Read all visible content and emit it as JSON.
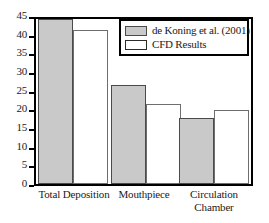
{
  "chart_data": {
    "type": "bar",
    "title": "",
    "xlabel": "",
    "ylabel": "",
    "ylim": [
      0,
      45
    ],
    "yticks": [
      0,
      5,
      10,
      15,
      20,
      25,
      30,
      35,
      40,
      45
    ],
    "grid": false,
    "legend_position": "top-right",
    "categories": [
      "Total Deposition",
      "Mouthpiece",
      "Circulation Chamber"
    ],
    "category_lines": [
      [
        "Total Deposition"
      ],
      [
        "Mouthpiece"
      ],
      [
        "Circulation",
        "Chamber"
      ]
    ],
    "series": [
      {
        "name": "de Koning et al. (2001)",
        "color": "#c9c9c9",
        "values": [
          45.0,
          27.0,
          18.0
        ]
      },
      {
        "name": "CFD Results",
        "color": "#ffffff",
        "values": [
          42.1,
          21.8,
          20.3
        ]
      }
    ]
  },
  "legend": {
    "entries": [
      {
        "label": "de Koning et al. (2001)",
        "swatch": "filled-gray-swatch"
      },
      {
        "label": "CFD Results",
        "swatch": "outline-white-swatch"
      }
    ]
  },
  "axis": {
    "y_tick_labels": [
      "45",
      "40",
      "35",
      "30",
      "25",
      "20",
      "15",
      "10",
      "5",
      "0"
    ]
  },
  "colors": {
    "series_a_fill": "#c9c9c9",
    "series_b_fill": "#ffffff",
    "frame": "#000000",
    "background": "#ffffff"
  }
}
